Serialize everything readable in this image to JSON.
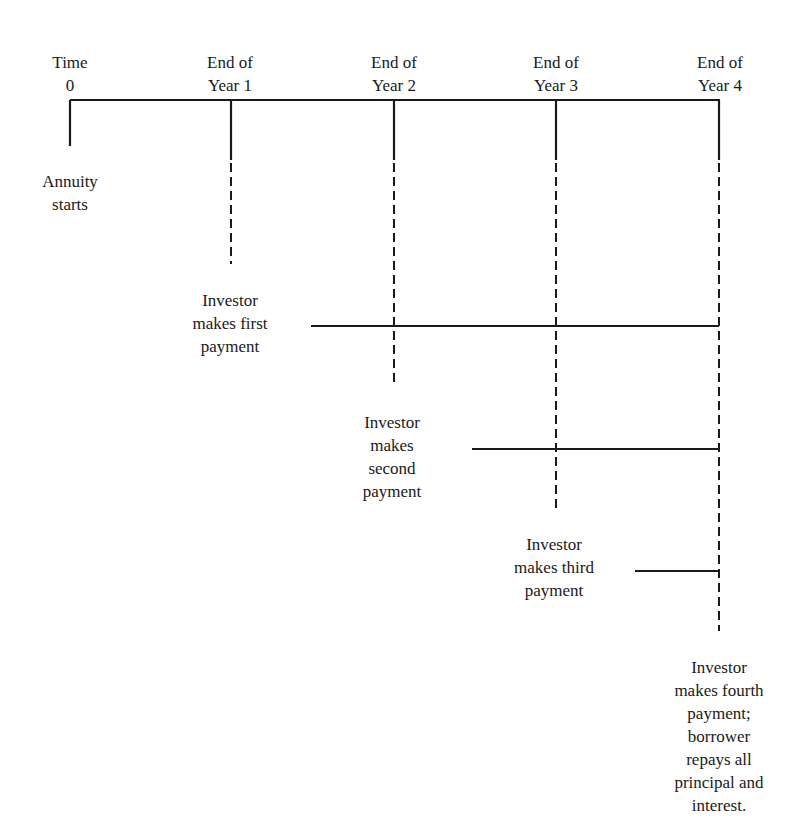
{
  "diagram": {
    "type": "timeline",
    "title": "",
    "timeline_labels": [
      {
        "id": "t0",
        "lines": [
          "Time",
          "0"
        ]
      },
      {
        "id": "y1",
        "lines": [
          "End of",
          "Year 1"
        ]
      },
      {
        "id": "y2",
        "lines": [
          "End of",
          "Year 2"
        ]
      },
      {
        "id": "y3",
        "lines": [
          "End of",
          "Year 3"
        ]
      },
      {
        "id": "y4",
        "lines": [
          "End of",
          "Year 4"
        ]
      }
    ],
    "events": [
      {
        "id": "start",
        "lines": [
          "Annuity",
          "starts"
        ]
      },
      {
        "id": "pay1",
        "lines": [
          "Investor",
          "makes first",
          "payment"
        ]
      },
      {
        "id": "pay2",
        "lines": [
          "Investor",
          "makes",
          "second",
          "payment"
        ]
      },
      {
        "id": "pay3",
        "lines": [
          "Investor",
          "makes third",
          "payment"
        ]
      },
      {
        "id": "pay4",
        "lines": [
          "Investor",
          "makes fourth",
          "payment;",
          "borrower",
          "repays all",
          "principal and",
          "interest."
        ]
      }
    ],
    "colors": {
      "line": "#1a1a1a",
      "background": "#ffffff"
    }
  }
}
